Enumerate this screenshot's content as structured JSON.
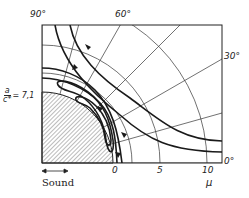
{
  "diagram": {
    "type": "polar streamline diagram",
    "angle_labels": {
      "a90": "90°",
      "a60": "60°",
      "a30": "30°",
      "a0": "0°"
    },
    "radial_labels": {
      "r0": "0",
      "r5": "5",
      "r10": "10"
    },
    "axis_label": "μ",
    "parameter": {
      "numerator": "a",
      "denominator": "c*",
      "value": "= 7,1"
    },
    "sound_label": "Sound",
    "colors": {
      "line": "#1a1a1a",
      "grid": "#333333",
      "hatch": "#555555",
      "background": "#ffffff"
    }
  }
}
